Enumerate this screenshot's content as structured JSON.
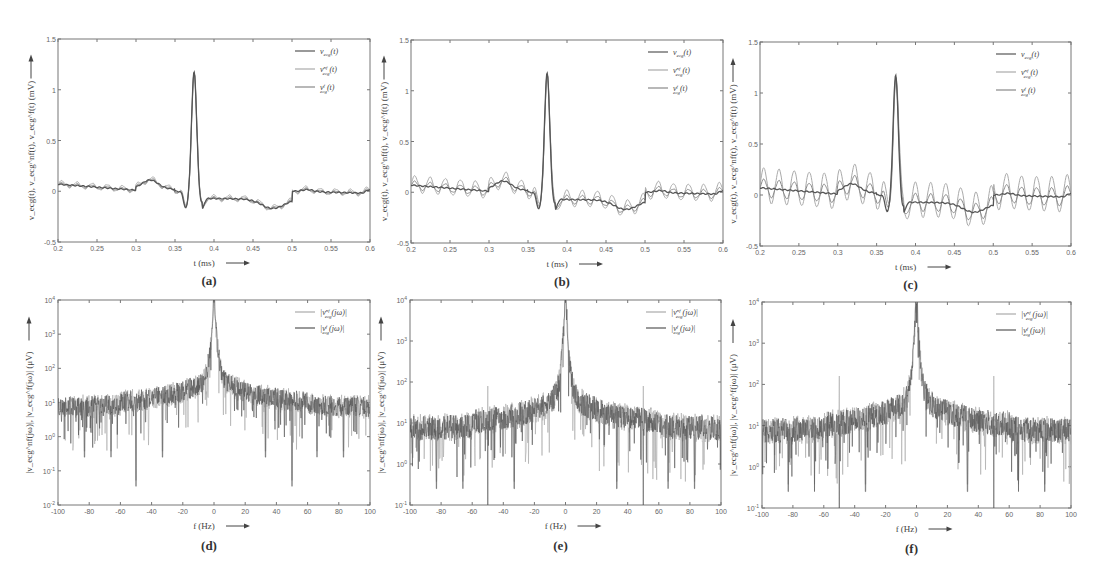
{
  "figure": {
    "captions": [
      "(a)",
      "(b)",
      "(c)",
      "(d)",
      "(e)",
      "(f)"
    ]
  },
  "chart_data": [
    {
      "id": "a",
      "type": "line",
      "caption": "(a)",
      "xlabel": "t (ms)",
      "ylabel": "v_ecg(t), v_ecg^nf(t), v_ecg^f(t) (mV)",
      "xlim": [
        0.2,
        0.6
      ],
      "ylim": [
        -0.5,
        1.5
      ],
      "xticks": [
        "0.2",
        "0.25",
        "0.3",
        "0.35",
        "0.4",
        "0.45",
        "0.5",
        "0.55",
        "0.6"
      ],
      "yticks": [
        "-0.5",
        "0",
        "0.5",
        "1",
        "1.5"
      ],
      "legend": [
        "v_ecg(t)",
        "v_ecg^nf(t)",
        "v_ecg^f(t)"
      ],
      "legend_position": "upper right",
      "grid": false,
      "noise_amplitude_mV": 0.03,
      "series": [
        {
          "name": "v_ecg(t)",
          "color": "#555555",
          "description": "clean ECG beat"
        },
        {
          "name": "v_ecg^nf(t)",
          "color": "#aaaaaa",
          "description": "noisy ECG, small 50Hz interference"
        },
        {
          "name": "v_ecg^f(t)",
          "color": "#888888",
          "description": "filtered ECG"
        }
      ],
      "key_points": {
        "peak_t": 0.375,
        "peak_v": 1.15,
        "trough_t": 0.365,
        "trough_v": -0.17,
        "t_wave_min_t": 0.475,
        "t_wave_min_v": -0.16
      }
    },
    {
      "id": "b",
      "type": "line",
      "caption": "(b)",
      "xlabel": "t (ms)",
      "ylabel": "v_ecg(t), v_ecg^nf(t), v_ecg^f(t) (mV)",
      "xlim": [
        0.2,
        0.6
      ],
      "ylim": [
        -0.5,
        1.5
      ],
      "xticks": [
        "0.2",
        "0.25",
        "0.3",
        "0.35",
        "0.4",
        "0.45",
        "0.5",
        "0.55",
        "0.6"
      ],
      "yticks": [
        "-0.5",
        "0",
        "0.5",
        "1",
        "1.5"
      ],
      "legend": [
        "v_ecg(t)",
        "v_ecg^nf(t)",
        "v_ecg^f(t)"
      ],
      "legend_position": "upper right",
      "grid": false,
      "noise_amplitude_mV": 0.08,
      "series": [
        {
          "name": "v_ecg(t)",
          "color": "#555555"
        },
        {
          "name": "v_ecg^nf(t)",
          "color": "#aaaaaa"
        },
        {
          "name": "v_ecg^f(t)",
          "color": "#888888"
        }
      ]
    },
    {
      "id": "c",
      "type": "line",
      "caption": "(c)",
      "xlabel": "t (ms)",
      "ylabel": "v_ecg(t), v_ecg^nf(t), v_ecg^f(t) (mV)",
      "xlim": [
        0.2,
        0.6
      ],
      "ylim": [
        -0.5,
        1.5
      ],
      "xticks": [
        "0.2",
        "0.25",
        "0.3",
        "0.35",
        "0.4",
        "0.45",
        "0.5",
        "0.55",
        "0.6"
      ],
      "yticks": [
        "-0.5",
        "0",
        "0.5",
        "1",
        "1.5"
      ],
      "legend": [
        "v_ecg(t)",
        "v_ecg^nf(t)",
        "v_ecg^f(t)"
      ],
      "legend_position": "upper right",
      "grid": false,
      "noise_amplitude_mV": 0.17,
      "series": [
        {
          "name": "v_ecg(t)",
          "color": "#555555"
        },
        {
          "name": "v_ecg^nf(t)",
          "color": "#aaaaaa"
        },
        {
          "name": "v_ecg^f(t)",
          "color": "#888888"
        }
      ]
    },
    {
      "id": "d",
      "type": "line",
      "yscale": "log",
      "caption": "(d)",
      "xlabel": "f (Hz)",
      "ylabel": "|v_ecg^nf(jω)|, |v_ecg^f(jω)| (μV)",
      "xlim": [
        -100,
        100
      ],
      "ylim": [
        0.01,
        10000
      ],
      "xticks": [
        "-100",
        "-80",
        "-60",
        "-40",
        "-20",
        "0",
        "20",
        "40",
        "60",
        "80",
        "100"
      ],
      "yticks": [
        "10^-2",
        "10^-1",
        "10^0",
        "10^1",
        "10^2",
        "10^3",
        "10^4"
      ],
      "legend": [
        "|v_ecg^nf(jω)|",
        "|v_ecg^f(jω)|"
      ],
      "legend_position": "upper right",
      "grid": false,
      "peak": {
        "f": 0,
        "value": 10000
      },
      "floor_level": 10,
      "notch_freqs": [
        -83,
        -66,
        -50,
        -33,
        33,
        50,
        66,
        83
      ],
      "spike_50Hz": false
    },
    {
      "id": "e",
      "type": "line",
      "yscale": "log",
      "caption": "(e)",
      "xlabel": "f (Hz)",
      "ylabel": "|v_ecg^nf(jω)|, |v_ecg^f(jω)| (μV)",
      "xlim": [
        -100,
        100
      ],
      "ylim": [
        0.1,
        10000
      ],
      "xticks": [
        "-100",
        "-80",
        "-60",
        "-40",
        "-20",
        "0",
        "20",
        "40",
        "60",
        "80",
        "100"
      ],
      "yticks": [
        "10^-1",
        "10^0",
        "10^1",
        "10^2",
        "10^3",
        "10^4"
      ],
      "legend": [
        "|v_ecg^nf(jω)|",
        "|v_ecg^f(jω)|"
      ],
      "legend_position": "upper right",
      "grid": false,
      "peak": {
        "f": 0,
        "value": 10000
      },
      "floor_level": 10,
      "notch_freqs": [
        -83,
        -66,
        -50,
        -33,
        33,
        50,
        66,
        83
      ],
      "spike_50Hz": true,
      "spike_50Hz_value": 80
    },
    {
      "id": "f",
      "type": "line",
      "yscale": "log",
      "caption": "(f)",
      "xlabel": "f (Hz)",
      "ylabel": "|v_ecg^nf(jω)|, |v_ecg^f(jω)| (μV)",
      "xlim": [
        -100,
        100
      ],
      "ylim": [
        0.1,
        10000
      ],
      "xticks": [
        "-100",
        "-80",
        "-60",
        "-40",
        "-20",
        "0",
        "20",
        "40",
        "60",
        "80",
        "100"
      ],
      "yticks": [
        "10^-1",
        "10^0",
        "10^1",
        "10^2",
        "10^3",
        "10^4"
      ],
      "legend": [
        "|v_ecg^nf(jω)|",
        "|v_ecg^f(jω)|"
      ],
      "legend_position": "upper right",
      "grid": false,
      "peak": {
        "f": 0,
        "value": 10000
      },
      "floor_level": 10,
      "notch_freqs": [
        -83,
        -66,
        -50,
        -33,
        33,
        50,
        66,
        83
      ],
      "spike_50Hz": true,
      "spike_50Hz_value": 160
    }
  ],
  "layout": {
    "panels": [
      {
        "id": "a",
        "x": 58,
        "y": 39,
        "w": 312,
        "h": 203
      },
      {
        "id": "b",
        "x": 411,
        "y": 40,
        "w": 312,
        "h": 203
      },
      {
        "id": "c",
        "x": 760,
        "y": 42,
        "w": 311,
        "h": 204
      },
      {
        "id": "d",
        "x": 58,
        "y": 300,
        "w": 312,
        "h": 205
      },
      {
        "id": "e",
        "x": 410,
        "y": 300,
        "w": 311,
        "h": 205
      },
      {
        "id": "f",
        "x": 762,
        "y": 302,
        "w": 309,
        "h": 206
      }
    ]
  }
}
